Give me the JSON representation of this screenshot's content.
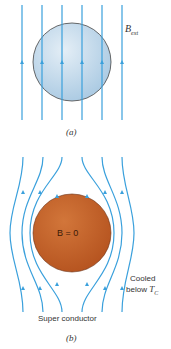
{
  "panel_a": {
    "caption": "(a)",
    "field_label": "B",
    "field_subscript": "ext",
    "sphere_color": "#c4dcef",
    "line_color": "#3aa0dc"
  },
  "panel_b": {
    "caption": "(b)",
    "sphere_label": "B = 0",
    "sphere_color": "#c8642a",
    "note_line1": "Cooled",
    "note_line2": "below",
    "note_T": "T",
    "note_T_sub": "C",
    "material_label": "Super conductor",
    "line_color": "#3aa0dc"
  }
}
